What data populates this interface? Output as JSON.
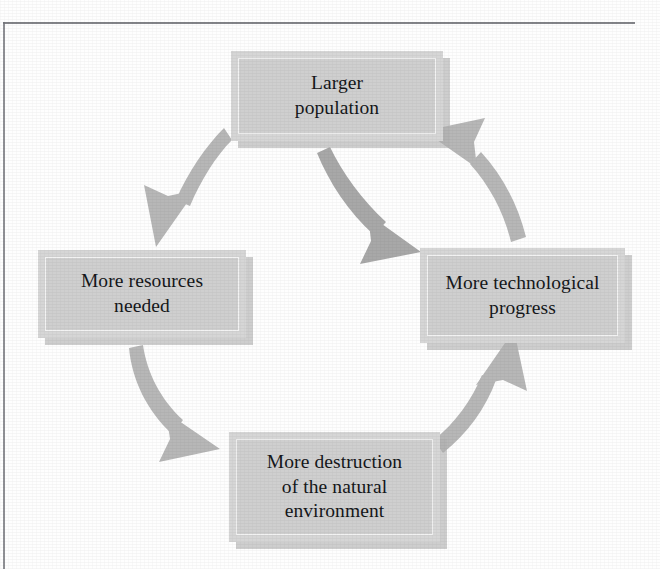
{
  "figure": {
    "type": "cycle-diagram",
    "title": "",
    "node_count": 4,
    "arrow_count": 5,
    "colors": {
      "node_fill": "#cfcfcf",
      "node_frame": "#d6d6d6",
      "node_inner_line": "#f3f3f3",
      "node_shadow": "#b0b0b0",
      "arrow": "#b7b7b7",
      "text": "#15171a",
      "rule": "#6e7076",
      "page_background": "#fefefe"
    },
    "nodes": [
      {
        "id": "larger-population",
        "position": "top",
        "lines": [
          "Larger",
          "population"
        ],
        "text": "Larger population"
      },
      {
        "id": "more-resources-needed",
        "position": "left",
        "lines": [
          "More resources",
          "needed"
        ],
        "text": "More resources needed"
      },
      {
        "id": "more-technological-progress",
        "position": "right",
        "lines": [
          "More technological",
          "progress"
        ],
        "text": "More technological progress"
      },
      {
        "id": "more-destruction-natural-environment",
        "position": "bottom",
        "lines": [
          "More destruction",
          "of the natural",
          "environment"
        ],
        "text": "More destruction of the natural environment"
      }
    ],
    "arrows": [
      {
        "id": "arrow-population-to-resources",
        "from": "larger-population",
        "to": "more-resources-needed",
        "direction": "down-left",
        "style": "curved-tapered"
      },
      {
        "id": "arrow-population-to-technology",
        "from": "larger-population",
        "to": "more-technological-progress",
        "direction": "down-right",
        "style": "curved-tapered"
      },
      {
        "id": "arrow-resources-to-destruction",
        "from": "more-resources-needed",
        "to": "more-destruction-natural-environment",
        "direction": "down-right",
        "style": "curved-tapered"
      },
      {
        "id": "arrow-destruction-to-technology",
        "from": "more-destruction-natural-environment",
        "to": "more-technological-progress",
        "direction": "up-right",
        "style": "curved-tapered"
      },
      {
        "id": "arrow-technology-to-population",
        "from": "more-technological-progress",
        "to": "larger-population",
        "direction": "up-left",
        "style": "curved-tapered"
      }
    ]
  }
}
